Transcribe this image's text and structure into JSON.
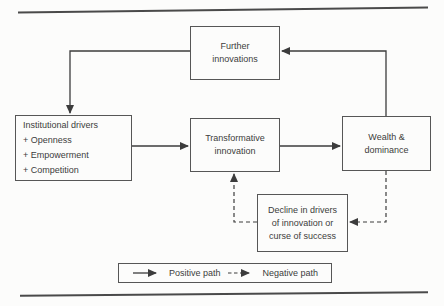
{
  "figure": {
    "colors": {
      "background": "#fcfcfb",
      "ink": "#3c3c3c",
      "border": "#565656"
    },
    "nodes": {
      "further_innovations": {
        "lines": [
          "Further",
          "innovations"
        ]
      },
      "institutional_drivers": {
        "lines": [
          "Institutional drivers",
          "+ Openness",
          "+ Empowerment",
          "+ Competition"
        ]
      },
      "transformative_innovation": {
        "lines": [
          "Transformative",
          "innovation"
        ]
      },
      "wealth_dominance": {
        "lines": [
          "Wealth &",
          "dominance"
        ]
      },
      "decline_drivers": {
        "lines": [
          "Decline in drivers",
          "of innovation or",
          "curse of success"
        ]
      }
    },
    "legend": {
      "positive": "Positive path",
      "negative": "Negative path"
    }
  }
}
